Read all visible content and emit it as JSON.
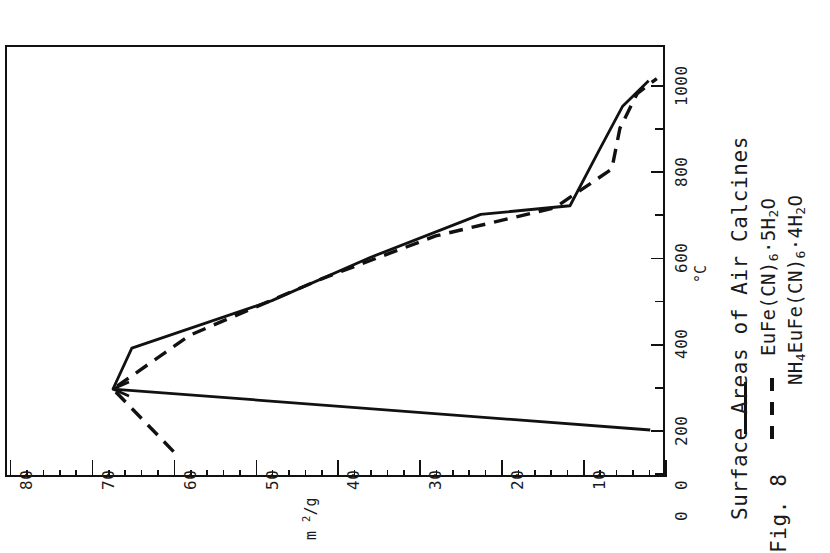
{
  "figure": {
    "label": "Fig. 8",
    "title": "Surface Areas of Air Calcines"
  },
  "legend": [
    {
      "style": "solid",
      "label_html": "EuFe(CN)<sub>6</sub>·5H<sub>2</sub>O",
      "label_text": "EuFe(CN)6·5H2O"
    },
    {
      "style": "dashed",
      "label_html": "NH<sub>4</sub>EuFe(CN)<sub>6</sub>·4H<sub>2</sub>O",
      "label_text": "NH4EuFe(CN)6·4H2O"
    }
  ],
  "axes": {
    "temperature": {
      "title": "°C",
      "ticks": [
        "0",
        "200",
        "400",
        "600",
        "800",
        "1000"
      ],
      "tick_values": [
        0,
        200,
        400,
        600,
        800,
        1000
      ],
      "range": [
        0,
        1080
      ]
    },
    "surface_area": {
      "title": "m 2/g",
      "title_parts": {
        "unit": "m",
        "exp": "2",
        "per": "/g"
      },
      "ticks": [
        "0",
        "10",
        "20",
        "30",
        "40",
        "50",
        "60",
        "70",
        "80"
      ],
      "tick_values": [
        0,
        10,
        20,
        30,
        40,
        50,
        60,
        70,
        80
      ],
      "range": [
        0,
        80
      ]
    }
  },
  "chart_data": {
    "type": "line",
    "title": "Surface Areas of Air Calcines",
    "xlabel": "°C",
    "ylabel": "m2/g",
    "xlim": [
      0,
      1080
    ],
    "ylim": [
      0,
      80
    ],
    "grid": false,
    "legend_position": "right-outside",
    "orientation": "rotated-90-ccw",
    "series": [
      {
        "name": "EuFe(CN)6·5H2O",
        "style": "solid",
        "points": [
          {
            "x": 200,
            "y": 1.8
          },
          {
            "x": 295,
            "y": 67.4
          },
          {
            "x": 390,
            "y": 65.1
          },
          {
            "x": 500,
            "y": 48.0
          },
          {
            "x": 600,
            "y": 36.0
          },
          {
            "x": 700,
            "y": 22.5
          },
          {
            "x": 720,
            "y": 11.6
          },
          {
            "x": 850,
            "y": 8.0
          },
          {
            "x": 950,
            "y": 5.2
          },
          {
            "x": 1010,
            "y": 2.0
          }
        ]
      },
      {
        "name": "NH4EuFe(CN)6·4H2O",
        "style": "dashed",
        "points": [
          {
            "x": 150,
            "y": 60.0
          },
          {
            "x": 295,
            "y": 67.4
          },
          {
            "x": 420,
            "y": 58.0
          },
          {
            "x": 550,
            "y": 42.0
          },
          {
            "x": 650,
            "y": 28.0
          },
          {
            "x": 715,
            "y": 13.5
          },
          {
            "x": 805,
            "y": 6.5
          },
          {
            "x": 900,
            "y": 5.5
          },
          {
            "x": 980,
            "y": 3.4
          },
          {
            "x": 1015,
            "y": 1.0
          }
        ]
      }
    ]
  }
}
